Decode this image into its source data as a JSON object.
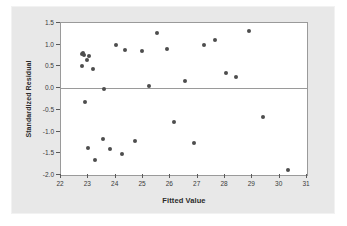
{
  "chart_data": {
    "type": "scatter",
    "title": "",
    "xlabel": "Fitted Value",
    "ylabel": "Standardized Residual",
    "xlim": [
      22,
      31
    ],
    "ylim": [
      -2.0,
      1.5
    ],
    "xticks": [
      "22",
      "23",
      "24",
      "25",
      "26",
      "27",
      "28",
      "29",
      "30",
      "31"
    ],
    "yticks": [
      "1.5",
      "1.0",
      "0.5",
      "0.0",
      "-0.5",
      "-1.0",
      "-1.5",
      "-2.0"
    ],
    "xtick_values": [
      22,
      23,
      24,
      25,
      26,
      27,
      28,
      29,
      30,
      31
    ],
    "ytick_values": [
      1.5,
      1.0,
      0.5,
      0.0,
      -0.5,
      -1.0,
      -1.5,
      -2.0
    ],
    "grid": false,
    "legend": false,
    "reference_line": {
      "axis": "y",
      "value": 0.0,
      "color": "#9a9a9a"
    },
    "marker": {
      "shape": "circle",
      "color": "#4d4d4d",
      "size": 4
    },
    "points": [
      {
        "x": 22.75,
        "y": 0.5
      },
      {
        "x": 22.78,
        "y": 0.79
      },
      {
        "x": 22.82,
        "y": 0.82
      },
      {
        "x": 22.84,
        "y": 0.76
      },
      {
        "x": 22.86,
        "y": -0.33
      },
      {
        "x": 22.95,
        "y": 0.65
      },
      {
        "x": 23.02,
        "y": 0.75
      },
      {
        "x": 23.0,
        "y": -1.38
      },
      {
        "x": 23.18,
        "y": 0.45
      },
      {
        "x": 23.25,
        "y": -1.66
      },
      {
        "x": 23.52,
        "y": -1.18
      },
      {
        "x": 23.58,
        "y": -0.03
      },
      {
        "x": 23.8,
        "y": -1.41
      },
      {
        "x": 24.0,
        "y": 1.0
      },
      {
        "x": 24.22,
        "y": -1.51
      },
      {
        "x": 24.33,
        "y": 0.88
      },
      {
        "x": 24.7,
        "y": -1.21
      },
      {
        "x": 24.98,
        "y": 0.86
      },
      {
        "x": 25.22,
        "y": 0.04
      },
      {
        "x": 25.52,
        "y": 1.26
      },
      {
        "x": 25.88,
        "y": 0.89
      },
      {
        "x": 26.15,
        "y": -0.79
      },
      {
        "x": 26.52,
        "y": 0.17
      },
      {
        "x": 26.88,
        "y": -1.27
      },
      {
        "x": 27.22,
        "y": 1.0
      },
      {
        "x": 27.62,
        "y": 1.1
      },
      {
        "x": 28.05,
        "y": 0.34
      },
      {
        "x": 28.4,
        "y": 0.25
      },
      {
        "x": 28.88,
        "y": 1.32
      },
      {
        "x": 29.38,
        "y": -0.66
      },
      {
        "x": 30.32,
        "y": -1.89
      }
    ]
  }
}
